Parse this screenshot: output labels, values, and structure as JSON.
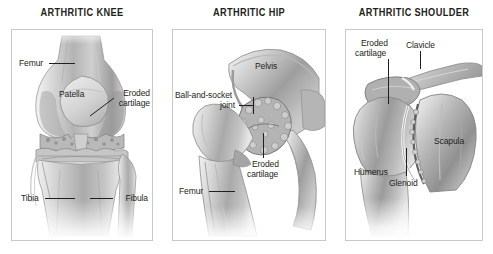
{
  "figure": {
    "kind": "medical-illustration",
    "background_color": "#ffffff",
    "border_color": "#c9c9c9",
    "text_color": "#231f20"
  },
  "panels": [
    {
      "id": "knee",
      "title": "ARTHRITIC KNEE",
      "labels": [
        {
          "name": "femur",
          "text": "Femur"
        },
        {
          "name": "patella",
          "text": "Patella"
        },
        {
          "name": "eroded-cartilage",
          "line1": "Eroded",
          "line2": "cartilage"
        },
        {
          "name": "tibia",
          "text": "Tibia"
        },
        {
          "name": "fibula",
          "text": "Fibula"
        }
      ]
    },
    {
      "id": "hip",
      "title": "ARTHRITIC HIP",
      "labels": [
        {
          "name": "pelvis",
          "text": "Pelvis"
        },
        {
          "name": "ball-and-socket-joint",
          "line1": "Ball-and-socket",
          "line2": "joint"
        },
        {
          "name": "eroded-cartilage",
          "line1": "Eroded",
          "line2": "cartilage"
        },
        {
          "name": "femur",
          "text": "Femur"
        }
      ]
    },
    {
      "id": "shoulder",
      "title": "ARTHRITIC SHOULDER",
      "labels": [
        {
          "name": "eroded-cartilage",
          "line1": "Eroded",
          "line2": "cartilage"
        },
        {
          "name": "clavicle",
          "text": "Clavicle"
        },
        {
          "name": "scapula",
          "text": "Scapula"
        },
        {
          "name": "humerus",
          "text": "Humerus"
        },
        {
          "name": "glenoid",
          "text": "Glenoid"
        }
      ]
    }
  ]
}
